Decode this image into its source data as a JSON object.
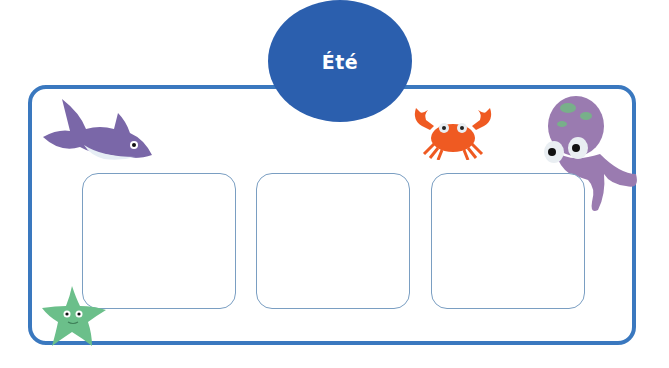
{
  "title": "Été",
  "colors": {
    "frame": "#3a78bf",
    "title_circle": "#2b5fae",
    "box_border": "#7a9ec2"
  },
  "boxes": [
    {
      "index": 1,
      "content": ""
    },
    {
      "index": 2,
      "content": ""
    },
    {
      "index": 3,
      "content": ""
    }
  ],
  "illustrations": [
    "shark",
    "crab",
    "octopus",
    "starfish"
  ]
}
